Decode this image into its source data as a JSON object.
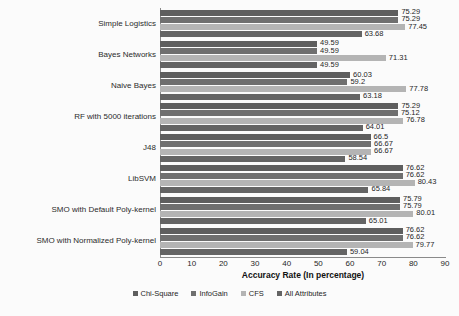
{
  "chart_data": {
    "type": "bar",
    "orientation": "horizontal",
    "title": "",
    "xlabel": "Accuracy Rate (In percentage)",
    "ylabel": "",
    "xlim": [
      0,
      90
    ],
    "xticks": [
      0,
      10,
      20,
      30,
      40,
      50,
      60,
      70,
      80,
      90
    ],
    "grid": false,
    "legend_position": "bottom",
    "categories": [
      "Simple Logistics",
      "Bayes Networks",
      "Naive Bayes",
      "RF with 5000 iterations",
      "J48",
      "LibSVM",
      "SMO with Default Poly-kernel",
      "SMO with Normalized Poly-kernel"
    ],
    "series": [
      {
        "name": "Chi-Square",
        "color": "#5e5e5e",
        "values": [
          75.29,
          49.59,
          60.03,
          75.29,
          66.5,
          76.62,
          75.79,
          76.62
        ]
      },
      {
        "name": "InfoGain",
        "color": "#6f6f6f",
        "values": [
          75.29,
          49.59,
          59.2,
          75.12,
          66.67,
          76.62,
          75.79,
          76.62
        ]
      },
      {
        "name": "CFS",
        "color": "#b4b4b4",
        "values": [
          77.45,
          71.31,
          77.78,
          76.78,
          66.67,
          80.43,
          80.01,
          79.77
        ]
      },
      {
        "name": "All Attributes",
        "color": "#646464",
        "values": [
          63.68,
          49.59,
          63.18,
          64.01,
          58.54,
          65.84,
          65.01,
          59.04
        ]
      }
    ],
    "value_labels": [
      [
        "75.29",
        "75.29",
        "77.45",
        "63.68"
      ],
      [
        "49.59",
        "49.59",
        "71.31",
        "49.59"
      ],
      [
        "60.03",
        "59.2",
        "77.78",
        "63.18"
      ],
      [
        "75.29",
        "75.12",
        "76.78",
        "64.01"
      ],
      [
        "66.5",
        "66.67",
        "66.67",
        "58.54"
      ],
      [
        "76.62",
        "76.62",
        "80.43",
        "65.84"
      ],
      [
        "75.79",
        "75.79",
        "80.01",
        "65.01"
      ],
      [
        "76.62",
        "76.62",
        "79.77",
        "59.04"
      ]
    ]
  }
}
